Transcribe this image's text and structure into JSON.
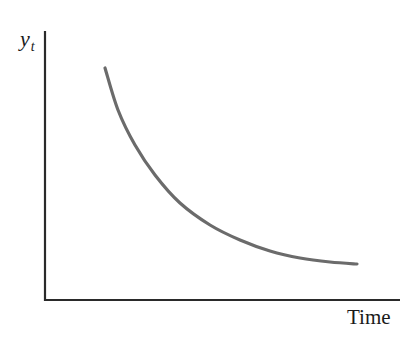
{
  "chart_data": {
    "type": "line",
    "title": "",
    "xlabel": "Time",
    "ylabel": "y_t",
    "ylabel_main": "y",
    "ylabel_sub": "t",
    "grid": false,
    "legend": null,
    "ticks": {
      "x": [],
      "y": []
    },
    "series": [
      {
        "name": "y_t",
        "color": "#6b6b6b",
        "points_px": [
          [
            105,
            68
          ],
          [
            118,
            110
          ],
          [
            135,
            145
          ],
          [
            155,
            175
          ],
          [
            180,
            203
          ],
          [
            210,
            225
          ],
          [
            240,
            240
          ],
          [
            270,
            251
          ],
          [
            300,
            258
          ],
          [
            330,
            262
          ],
          [
            357,
            264
          ]
        ],
        "relative_values": [
          {
            "t": 0.17,
            "y": 0.86
          },
          {
            "t": 0.21,
            "y": 0.71
          },
          {
            "t": 0.26,
            "y": 0.58
          },
          {
            "t": 0.31,
            "y": 0.47
          },
          {
            "t": 0.38,
            "y": 0.36
          },
          {
            "t": 0.47,
            "y": 0.28
          },
          {
            "t": 0.55,
            "y": 0.22
          },
          {
            "t": 0.63,
            "y": 0.18
          },
          {
            "t": 0.72,
            "y": 0.16
          },
          {
            "t": 0.8,
            "y": 0.14
          },
          {
            "t": 0.88,
            "y": 0.13
          }
        ]
      }
    ],
    "axes": {
      "origin_px": [
        45,
        300
      ],
      "y_axis_top_px": [
        45,
        31
      ],
      "x_axis_right_px": [
        400,
        300
      ]
    }
  }
}
